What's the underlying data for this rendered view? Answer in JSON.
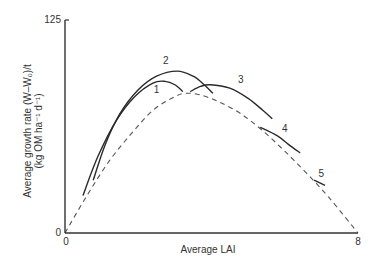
{
  "chart_data": {
    "type": "line",
    "title": "",
    "xlabel": "Average LAI",
    "ylabel_line1": "Average growth rate (W–W₀)/t",
    "ylabel_line2": "(kg OM ha⁻¹ d⁻¹)",
    "xlim": [
      0,
      8
    ],
    "ylim": [
      0,
      125
    ],
    "x_ticks": [
      "0",
      "8"
    ],
    "y_ticks": [
      "0",
      "125"
    ],
    "grid": false,
    "legend": "none (curves labelled inline 1–5)",
    "colors": {
      "solid": "#2a2a2a",
      "dashed": "#555555",
      "axis": "#333333"
    },
    "series": [
      {
        "name": "envelope",
        "style": "dashed",
        "points": [
          [
            0,
            0
          ],
          [
            0.6,
            22
          ],
          [
            1.2,
            42
          ],
          [
            1.8,
            58
          ],
          [
            2.4,
            72
          ],
          [
            3.0,
            80
          ],
          [
            3.3,
            82
          ],
          [
            3.7,
            81
          ],
          [
            4.2,
            77
          ],
          [
            4.8,
            70
          ],
          [
            5.4,
            60
          ],
          [
            6.0,
            48
          ],
          [
            6.6,
            35
          ],
          [
            7.2,
            21
          ],
          [
            8,
            0
          ]
        ]
      },
      {
        "name": "1",
        "label": "1",
        "style": "solid",
        "points": [
          [
            0.49,
            22
          ],
          [
            0.9,
            45
          ],
          [
            1.4,
            66
          ],
          [
            1.9,
            80
          ],
          [
            2.4,
            88
          ],
          [
            2.73,
            89
          ],
          [
            3.0,
            87
          ],
          [
            3.22,
            83
          ]
        ],
        "label_pos": [
          2.5,
          82
        ]
      },
      {
        "name": "2",
        "label": "2",
        "style": "solid",
        "points": [
          [
            0.77,
            31
          ],
          [
            1.1,
            52
          ],
          [
            1.5,
            70
          ],
          [
            2.0,
            84
          ],
          [
            2.5,
            92
          ],
          [
            3.06,
            95
          ],
          [
            3.5,
            92
          ],
          [
            3.8,
            87
          ],
          [
            4.04,
            82
          ]
        ],
        "label_pos": [
          2.75,
          99
        ]
      },
      {
        "name": "3",
        "label": "3",
        "style": "solid",
        "points": [
          [
            3.42,
            83
          ],
          [
            3.7,
            86
          ],
          [
            3.96,
            87
          ],
          [
            4.5,
            85
          ],
          [
            5.0,
            79
          ],
          [
            5.4,
            72
          ],
          [
            5.66,
            67
          ]
        ],
        "label_pos": [
          4.8,
          88
        ]
      },
      {
        "name": "4",
        "label": "4",
        "style": "solid",
        "points": [
          [
            5.33,
            62
          ],
          [
            5.8,
            57
          ],
          [
            6.1,
            52
          ],
          [
            6.42,
            47
          ]
        ],
        "label_pos": [
          6.0,
          59
        ]
      },
      {
        "name": "5",
        "label": "5",
        "style": "solid",
        "points": [
          [
            6.8,
            31
          ],
          [
            7.1,
            28
          ]
        ],
        "label_pos": [
          7.0,
          33
        ]
      }
    ]
  }
}
